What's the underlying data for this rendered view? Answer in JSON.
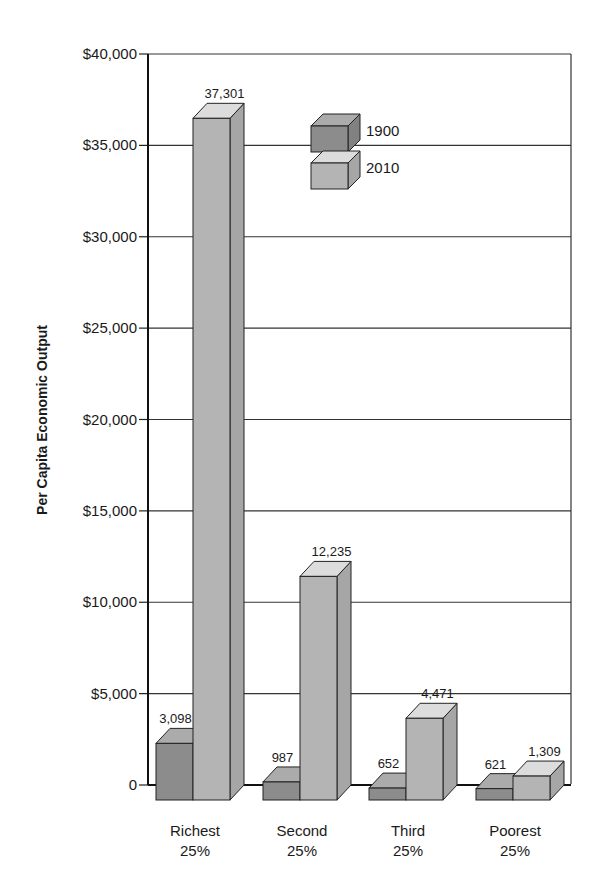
{
  "chart_data": {
    "type": "bar",
    "title": "",
    "xlabel": "",
    "ylabel": "Per Capita Economic Output",
    "ylim": [
      0,
      40000
    ],
    "yticks": [
      0,
      5000,
      10000,
      15000,
      20000,
      25000,
      30000,
      35000,
      40000
    ],
    "ytick_labels": [
      "0",
      "$5,000",
      "$10,000",
      "$15,000",
      "$20,000",
      "$25,000",
      "$30,000",
      "$35,000",
      "$40,000"
    ],
    "grid": true,
    "legend_position": "upper center",
    "style": "3d-bars",
    "categories": [
      {
        "line1": "Richest",
        "line2": "25%"
      },
      {
        "line1": "Second",
        "line2": "25%"
      },
      {
        "line1": "Third",
        "line2": "25%"
      },
      {
        "line1": "Poorest",
        "line2": "25%"
      }
    ],
    "series": [
      {
        "name": "1900",
        "color": "#8c8c8c",
        "values": [
          3098,
          987,
          652,
          621
        ],
        "labels": [
          "3,098",
          "987",
          "652",
          "621"
        ]
      },
      {
        "name": "2010",
        "color": "#b4b4b4",
        "values": [
          37301,
          12235,
          4471,
          1309
        ],
        "labels": [
          "37,301",
          "12,235",
          "4,471",
          "1,309"
        ]
      }
    ]
  },
  "legend": {
    "items": [
      {
        "label": "1900"
      },
      {
        "label": "2010"
      }
    ]
  }
}
